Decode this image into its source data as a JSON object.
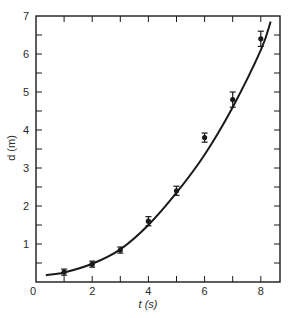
{
  "chart_data": {
    "type": "scatter",
    "title": "",
    "xlabel": "t (s)",
    "ylabel": "d (m)",
    "xlim": [
      0,
      8.5
    ],
    "ylim": [
      0,
      7
    ],
    "x_ticks_major": [
      0,
      2,
      4,
      6,
      8
    ],
    "x_ticks_minor_step": 1,
    "y_ticks_major": [
      1,
      2,
      3,
      4,
      5,
      6,
      7
    ],
    "y_ticks_minor_step": 0.5,
    "grid": false,
    "legend": null,
    "series": [
      {
        "name": "measured",
        "marker": "dot-with-error-bars",
        "x": [
          1,
          2,
          3,
          4,
          5,
          6,
          7,
          8
        ],
        "y": [
          0.26,
          0.47,
          0.84,
          1.6,
          2.4,
          3.8,
          4.8,
          6.4
        ],
        "yerr": [
          0.08,
          0.08,
          0.08,
          0.12,
          0.12,
          0.12,
          0.2,
          0.2
        ]
      },
      {
        "name": "fit curve",
        "type": "line",
        "x": [
          0.35,
          1,
          2,
          3,
          4,
          5,
          6,
          7,
          8,
          8.35
        ],
        "y": [
          0.18,
          0.25,
          0.48,
          0.86,
          1.5,
          2.35,
          3.35,
          4.6,
          6.1,
          6.85
        ]
      }
    ]
  },
  "labels": {
    "x_axis_title": "t (s)",
    "y_axis_title": "d (m)"
  }
}
